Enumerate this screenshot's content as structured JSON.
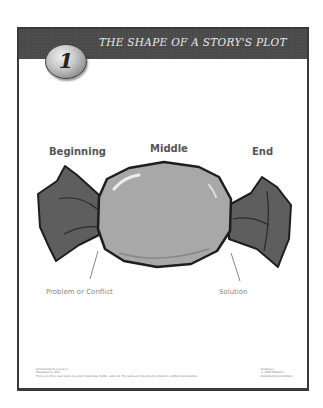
{
  "header": {
    "number": "1",
    "title": "THE SHAPE OF A STORY'S PLOT"
  },
  "diagram": {
    "labels": {
      "beginning": "Beginning",
      "middle": "Middle",
      "end": "End",
      "problem": "Problem or Conflict",
      "solution": "Solution"
    },
    "colors": {
      "wrapper": "#5e5e5e",
      "candy": "#a8a8a8",
      "outline": "#1e1e1e",
      "frame": "#3a3a3a",
      "header_bar": "#4a4a4a"
    }
  },
  "footer": {
    "left_lines": [
      "Introduction to Lesson 4",
      "Transparency: Plot",
      "There are three main parts to a plot: beginning, middle, and end. The parts are linked by the problem (conflict) and solution."
    ],
    "right_lines": [
      "Reading 1",
      "© 2000 Publisher",
      "Reproduction prohibited."
    ]
  }
}
